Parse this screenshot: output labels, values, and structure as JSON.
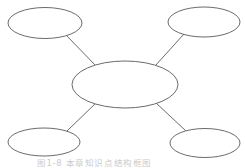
{
  "figure": {
    "kind": "bubble-diagram",
    "title": "",
    "caption": "图1-8 本章知识点结构框图",
    "background_color": "#ffffff",
    "stroke_color": "#5a5a5a",
    "fill_color": "#ffffff",
    "stroke_width": 0.9,
    "caption_color": "#b9b9b9"
  },
  "nodes": [
    {
      "id": "center",
      "role": "central-node",
      "label": "",
      "cx": 125,
      "cy": 84.5,
      "rx": 53,
      "ry": 23.5
    },
    {
      "id": "top-left",
      "role": "satellite-node",
      "label": "",
      "cx": 45,
      "cy": 23,
      "rx": 37,
      "ry": 15.5
    },
    {
      "id": "top-right",
      "role": "satellite-node",
      "label": "",
      "cx": 204,
      "cy": 22,
      "rx": 36,
      "ry": 15
    },
    {
      "id": "bottom-left",
      "role": "satellite-node",
      "label": "",
      "cx": 44,
      "cy": 142,
      "rx": 36,
      "ry": 14
    },
    {
      "id": "bottom-right",
      "role": "satellite-node",
      "label": "",
      "cx": 205,
      "cy": 143,
      "rx": 35,
      "ry": 14.5
    }
  ],
  "connectors": [
    {
      "id": "center-to-top-left",
      "from": "center",
      "to": "top-left",
      "x1": 97,
      "y1": 67,
      "x2": 66,
      "y2": 35
    },
    {
      "id": "center-to-top-right",
      "from": "center",
      "to": "top-right",
      "x1": 155,
      "y1": 66,
      "x2": 184,
      "y2": 34
    },
    {
      "id": "center-to-bottom-left",
      "from": "center",
      "to": "bottom-left",
      "x1": 97,
      "y1": 102,
      "x2": 66,
      "y2": 132
    },
    {
      "id": "center-to-bottom-right",
      "from": "center",
      "to": "bottom-right",
      "x1": 155,
      "y1": 102,
      "x2": 186,
      "y2": 131
    }
  ]
}
